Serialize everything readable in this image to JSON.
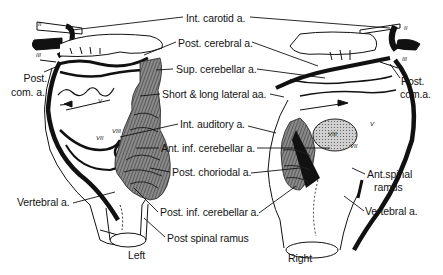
{
  "diagram": {
    "views": {
      "left": "Left",
      "right": "Right"
    },
    "center_labels": [
      "Int. carotid a.",
      "Post. cerebral a.",
      "Sup. cerebellar a.",
      "Short & long lateral aa.",
      "Int. auditory a.",
      "Ant. inf. cerebellar a.",
      "Post. choriodal a.",
      "Post. inf. cerebellar a.",
      "Post spinal ramus"
    ],
    "left_labels": {
      "post_com_line1": "Post.",
      "post_com_line2": "com. a.",
      "vertebral": "Vertebral a."
    },
    "right_labels": {
      "post_com_line1": "Post.",
      "post_com_line2": "com.a.",
      "ant_spinal_line1": "Ant.spinal",
      "ant_spinal_line2": "ramus",
      "vertebral": "Vertebral a."
    },
    "nerve_numerals": {
      "left": [
        "II",
        "III",
        "V",
        "VII",
        "VIII"
      ],
      "right": [
        "II",
        "III",
        "V",
        "VII",
        "VIII",
        "VI"
      ]
    },
    "colors": {
      "ink": "#111111",
      "shading": "#6e6e6e",
      "background": "#ffffff"
    }
  }
}
